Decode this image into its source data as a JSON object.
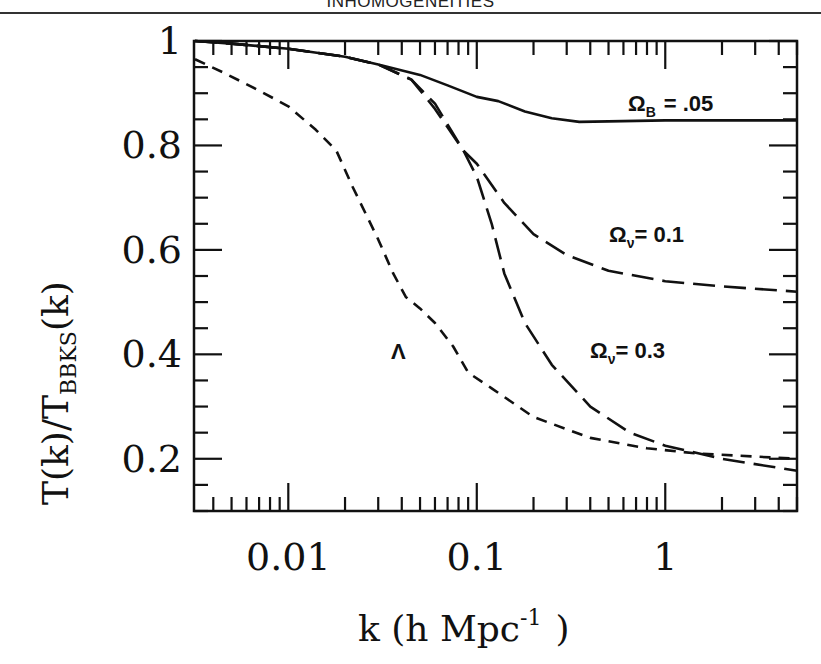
{
  "page": {
    "running_head": "INHOMOGENEITIES"
  },
  "chart_data": {
    "type": "line",
    "title": "",
    "xlabel": "k (h Mpc⁻¹ )",
    "xlabel_main": "k (h Mpc",
    "xlabel_sup": "-1",
    "xlabel_close": ")",
    "ylabel": "T(k)/T_BBKS(k)",
    "ylabel_main": "T(k)/T",
    "ylabel_sub": "BBKS",
    "ylabel_tail": "(k)",
    "xscale": "log",
    "xlim": [
      0.00316,
      5.0
    ],
    "ylim": [
      0.1,
      1.0
    ],
    "xticks": [
      {
        "value": 0.01,
        "label": "0.01"
      },
      {
        "value": 0.1,
        "label": "0.1"
      },
      {
        "value": 1,
        "label": "1"
      }
    ],
    "yticks": [
      {
        "value": 0.2,
        "label": "0.2"
      },
      {
        "value": 0.4,
        "label": "0.4"
      },
      {
        "value": 0.6,
        "label": "0.6"
      },
      {
        "value": 0.8,
        "label": "0.8"
      },
      {
        "value": 1.0,
        "label": "1"
      }
    ],
    "grid": false,
    "legend": "inline labels",
    "series": [
      {
        "name": "Omega_B = .05",
        "label_main": "Ω",
        "label_sub": "B",
        "label_rest": "=  .05",
        "style": "solid",
        "x": [
          0.0032,
          0.005,
          0.01,
          0.02,
          0.03,
          0.05,
          0.07,
          0.1,
          0.13,
          0.18,
          0.25,
          0.35,
          0.5,
          1.0,
          2.0,
          5.0
        ],
        "y": [
          1.0,
          0.995,
          0.985,
          0.97,
          0.955,
          0.935,
          0.915,
          0.893,
          0.885,
          0.865,
          0.852,
          0.845,
          0.846,
          0.848,
          0.848,
          0.848
        ]
      },
      {
        "name": "Omega_nu = 0.1",
        "label_main": "Ω",
        "label_sub": "ν",
        "label_rest": "=  0.1",
        "style": "long-dash",
        "x": [
          0.0032,
          0.005,
          0.01,
          0.02,
          0.03,
          0.045,
          0.06,
          0.085,
          0.1,
          0.14,
          0.2,
          0.3,
          0.5,
          1.0,
          2.0,
          5.0
        ],
        "y": [
          1.0,
          0.995,
          0.985,
          0.97,
          0.955,
          0.926,
          0.88,
          0.79,
          0.765,
          0.69,
          0.63,
          0.59,
          0.56,
          0.54,
          0.53,
          0.52
        ]
      },
      {
        "name": "Omega_nu = 0.3",
        "label_main": "Ω",
        "label_sub": "ν",
        "label_rest": "=  0.3",
        "style": "long-dash",
        "x": [
          0.0032,
          0.005,
          0.01,
          0.02,
          0.03,
          0.045,
          0.06,
          0.085,
          0.1,
          0.12,
          0.14,
          0.18,
          0.25,
          0.4,
          0.65,
          1.0,
          2.0,
          5.0
        ],
        "y": [
          1.0,
          0.995,
          0.985,
          0.97,
          0.955,
          0.926,
          0.87,
          0.79,
          0.74,
          0.65,
          0.555,
          0.46,
          0.38,
          0.3,
          0.25,
          0.225,
          0.2,
          0.177
        ]
      },
      {
        "name": "Lambda",
        "label_main": "Λ",
        "label_sub": "",
        "label_rest": "",
        "style": "short-dash",
        "x": [
          0.0032,
          0.0045,
          0.007,
          0.01,
          0.014,
          0.018,
          0.022,
          0.03,
          0.036,
          0.042,
          0.05,
          0.06,
          0.075,
          0.09,
          0.12,
          0.2,
          0.4,
          0.8,
          1.5,
          5.0
        ],
        "y": [
          0.965,
          0.94,
          0.905,
          0.875,
          0.83,
          0.79,
          0.72,
          0.62,
          0.555,
          0.51,
          0.488,
          0.46,
          0.415,
          0.365,
          0.335,
          0.28,
          0.24,
          0.22,
          0.21,
          0.2
        ]
      }
    ]
  }
}
